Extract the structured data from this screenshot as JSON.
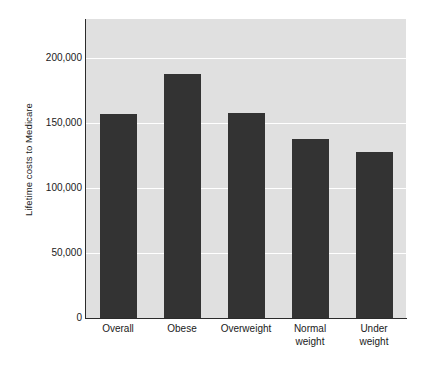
{
  "chart_data": {
    "type": "bar",
    "title": "",
    "subtitle": "",
    "xlabel": "",
    "ylabel": "Lifetime costs to Medicare",
    "categories": [
      "Overall",
      "Obese",
      "Overweight",
      "Normal weight",
      "Under weight"
    ],
    "category_lines": [
      [
        "Overall"
      ],
      [
        "Obese"
      ],
      [
        "Overweight"
      ],
      [
        "Normal",
        "weight"
      ],
      [
        "Under",
        "weight"
      ]
    ],
    "values": [
      157000,
      188000,
      158000,
      138000,
      128000
    ],
    "ylim": [
      0,
      230000
    ],
    "yticks": [
      0,
      50000,
      100000,
      150000,
      200000
    ],
    "ytick_labels": [
      "0",
      "50,000",
      "100,000",
      "150,000",
      "200,000"
    ],
    "grid": true,
    "grid_axis": "y",
    "legend": false,
    "legend_position": "none",
    "colors": {
      "bar": "#333333",
      "plot_background": "#e0e0e0",
      "figure_background": "#ffffff",
      "gridline": "#ffffff",
      "axis": "#2b2b2b",
      "text": "#1a1a1a"
    }
  }
}
